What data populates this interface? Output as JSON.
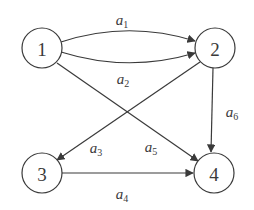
{
  "diagram": {
    "type": "directed-graph",
    "title": "",
    "stroke_color": "#3a3a3a",
    "background_color": "#ffffff",
    "node_fill": "#ffffff",
    "stroke_width": 1.2,
    "node_radius": 20,
    "nodes": [
      {
        "id": "1",
        "label": "1",
        "cx": 42,
        "cy": 48
      },
      {
        "id": "2",
        "label": "2",
        "cx": 215,
        "cy": 48
      },
      {
        "id": "3",
        "label": "3",
        "cx": 42,
        "cy": 173
      },
      {
        "id": "4",
        "label": "4",
        "cx": 214,
        "cy": 173
      }
    ],
    "edges": [
      {
        "id": "a1",
        "from": "1",
        "to": "2",
        "label_base": "a",
        "label_sub": "1",
        "shape": "curve-up",
        "path": "M 61 42 Q 128 20 195 41",
        "label_x": 122,
        "label_y": 20
      },
      {
        "id": "a2",
        "from": "1",
        "to": "2",
        "label_base": "a",
        "label_sub": "2",
        "shape": "curve-down",
        "path": "M 61 52 Q 128 73 195 53",
        "label_x": 123,
        "label_y": 79
      },
      {
        "id": "a3",
        "from": "2",
        "to": "3",
        "label_base": "a",
        "label_sub": "3",
        "shape": "straight-diagonal",
        "path": "M 200 62 L 57 160",
        "label_x": 96,
        "label_y": 148
      },
      {
        "id": "a4",
        "from": "3",
        "to": "4",
        "label_base": "a",
        "label_sub": "4",
        "shape": "straight-horizontal",
        "path": "M 62 173 L 193 173",
        "label_x": 122,
        "label_y": 194
      },
      {
        "id": "a5",
        "from": "1",
        "to": "4",
        "label_base": "a",
        "label_sub": "5",
        "shape": "straight-diagonal",
        "path": "M 57 63 L 198 161",
        "label_x": 151,
        "label_y": 147
      },
      {
        "id": "a6",
        "from": "2",
        "to": "4",
        "label_base": "a",
        "label_sub": "6",
        "shape": "straight-vertical",
        "path": "M 213 68 L 211 152",
        "label_x": 232,
        "label_y": 112
      }
    ]
  }
}
